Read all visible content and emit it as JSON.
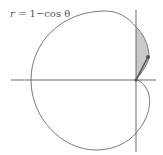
{
  "equation": {
    "lhs": "r",
    "rhs": "= 1−cos θ"
  },
  "colors": {
    "curve": "#7a7a7a",
    "axis": "#6a6a6a",
    "shade": "#c9c9c9",
    "radius_segment": "#555555",
    "point": "#555555"
  },
  "diagram": {
    "curve_name": "cardioid",
    "shaded_region": "area between curve and vertical axis in first quadrant",
    "marked_point": "point on curve joined to origin"
  }
}
